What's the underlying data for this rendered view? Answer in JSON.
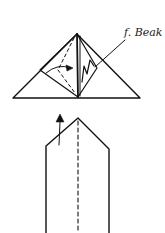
{
  "diagram": {
    "type": "origami-folding-instructions",
    "step1": {
      "label": "f. Beak",
      "shape": "triangle",
      "features": [
        "valley-fold dashed lines",
        "curved arrow",
        "zigzag beak pleat",
        "leader line"
      ]
    },
    "step2": {
      "shape": "pointed strip",
      "features": [
        "dashed center fold line",
        "upward arrow"
      ]
    },
    "colors": {
      "line": "#111111",
      "background": "#ffffff"
    }
  }
}
